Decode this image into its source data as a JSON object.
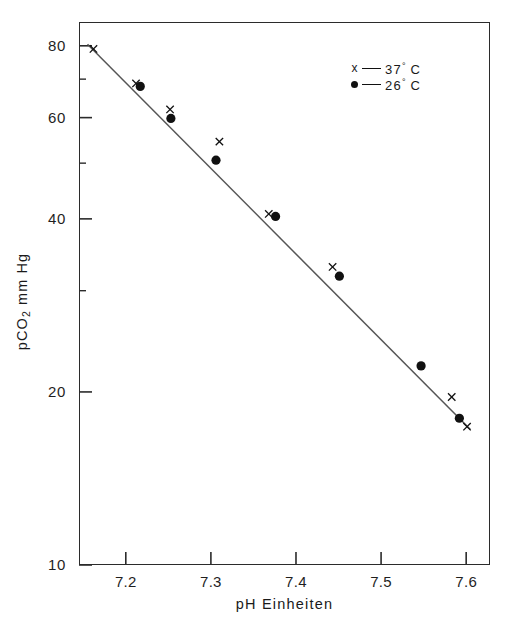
{
  "chart_data": {
    "type": "scatter",
    "title": "",
    "xlabel": "pH Einheiten",
    "ylabel": "pCO2 mm Hg",
    "ylabel_parts": {
      "pre": "pCO",
      "sub": "2",
      "post": " mm Hg"
    },
    "xlim": [
      7.145,
      7.628
    ],
    "ylim": [
      10,
      88
    ],
    "yscale": "log",
    "xscale": "linear",
    "grid": false,
    "legend_position": "top-right",
    "xticks": [
      "7.2",
      "7.3",
      "7.4",
      "7.5",
      "7.6"
    ],
    "xtick_values": [
      7.2,
      7.3,
      7.4,
      7.5,
      7.6
    ],
    "yticks": [
      "10",
      "20",
      "40",
      "60",
      "80"
    ],
    "ytick_values": [
      10,
      20,
      40,
      60,
      80
    ],
    "yminor_values": [
      70,
      50,
      30
    ],
    "line": {
      "x_start": 7.155,
      "y_start": 80.5,
      "x_end": 7.605,
      "y_end": 17.2
    },
    "series": [
      {
        "name": "37 C",
        "marker": "x",
        "legend_label": "37",
        "legend_unit": "C",
        "legend_degree": "°",
        "points": [
          {
            "x": 7.162,
            "y": 79.0
          },
          {
            "x": 7.212,
            "y": 68.8
          },
          {
            "x": 7.252,
            "y": 62.0
          },
          {
            "x": 7.31,
            "y": 54.5
          },
          {
            "x": 7.368,
            "y": 40.8
          },
          {
            "x": 7.443,
            "y": 33.0
          },
          {
            "x": 7.583,
            "y": 19.6
          },
          {
            "x": 7.601,
            "y": 17.4
          }
        ]
      },
      {
        "name": "26 C",
        "marker": "circle",
        "legend_label": "26",
        "legend_unit": "C",
        "legend_degree": "°",
        "points": [
          {
            "x": 7.217,
            "y": 68.0
          },
          {
            "x": 7.253,
            "y": 59.8
          },
          {
            "x": 7.306,
            "y": 50.6
          },
          {
            "x": 7.376,
            "y": 40.4
          },
          {
            "x": 7.451,
            "y": 31.8
          },
          {
            "x": 7.547,
            "y": 22.2
          },
          {
            "x": 7.592,
            "y": 18.0
          }
        ]
      }
    ]
  },
  "legend": {
    "rows": [
      {
        "marker": "x",
        "value": "37",
        "degree": "°",
        "unit": "C"
      },
      {
        "marker": "●",
        "value": "26",
        "degree": "°",
        "unit": "C"
      }
    ]
  },
  "axis_titles": {
    "x": "pH Einheiten",
    "y_pre": "pCO",
    "y_sub": "2",
    "y_post": " mm Hg"
  },
  "colors": {
    "axis": "#2b2b2b",
    "marker": "#111111",
    "line": "#555555",
    "background": "#ffffff"
  }
}
